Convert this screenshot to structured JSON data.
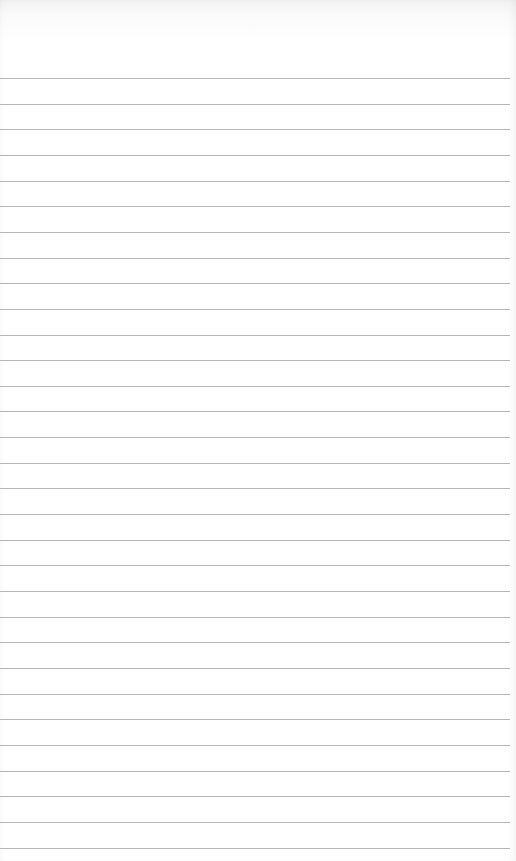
{
  "image": {
    "description": "Blank ruled notebook paper",
    "background_color": "#ffffff",
    "line_color": "#a9a9a9",
    "first_line_y": 78,
    "line_spacing": 25.65,
    "line_count": 31
  }
}
